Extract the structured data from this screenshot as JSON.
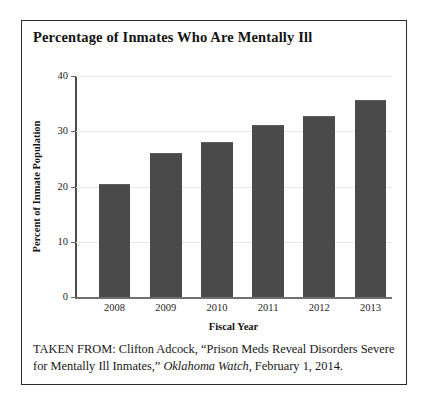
{
  "figure": {
    "title": "Percentage of Inmates Who Are Mentally Ill",
    "caption": {
      "prefix": "TAKEN FROM: Clifton Adcock, “Prison Meds Reveal Disorders Severe for Mentally Ill Inmates,” ",
      "publication": "Oklahoma Watch",
      "suffix": ", February 1, 2014."
    }
  },
  "chart_data": {
    "type": "bar",
    "title": "Percentage of Inmates Who Are Mentally Ill",
    "xlabel": "Fiscal Year",
    "ylabel": "Percent of Inmate Population",
    "categories": [
      "2008",
      "2009",
      "2010",
      "2011",
      "2012",
      "2013"
    ],
    "values": [
      20.2,
      25.8,
      27.9,
      31.0,
      32.6,
      35.5
    ],
    "ylim": [
      0,
      40
    ],
    "yticks": [
      0,
      10,
      20,
      30,
      40
    ],
    "ytick_labels": [
      "0",
      "10",
      "20",
      "30",
      "40"
    ],
    "grid": true,
    "legend": false,
    "series": [
      {
        "name": "Percent of Inmate Population",
        "values": [
          20.2,
          25.8,
          27.9,
          31.0,
          32.6,
          35.5
        ]
      }
    ],
    "colors": {
      "bar": "#4a4a4a",
      "axis": "#4b4b4b",
      "grid": "#e7e7e7",
      "frame": "#2b2b2b",
      "background": "#ffffff"
    }
  }
}
